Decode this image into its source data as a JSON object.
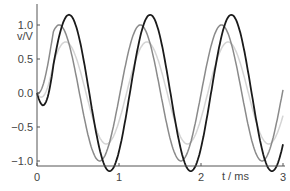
{
  "chart_data": {
    "type": "line",
    "title": "",
    "xlabel": "t / ms",
    "ylabel": "v/V",
    "xlim": [
      0,
      3
    ],
    "ylim": [
      -1.1,
      1.2
    ],
    "grid": false,
    "legend": null,
    "x_ticks": [
      "0",
      "1",
      "2",
      "3"
    ],
    "y_ticks": [
      "1.0",
      "0.5",
      "0.0",
      "−0.5",
      "−1.0"
    ],
    "series": [
      {
        "name": "black",
        "color": "#1a1a1a",
        "amplitude": 1.15,
        "period_ms": 0.99,
        "peaks_t": [
          0.39,
          1.38,
          2.37
        ],
        "troughs_t": [
          0.88,
          1.87,
          2.86
        ]
      },
      {
        "name": "gray",
        "color": "#8a8a8a",
        "amplitude": 1.0,
        "period_ms": 0.99,
        "peaks_t": [
          0.27,
          1.26,
          2.24
        ],
        "troughs_t": [
          0.72,
          1.71,
          2.7
        ]
      },
      {
        "name": "light-gray",
        "color": "#d4d4d4",
        "amplitude": 0.75,
        "period_ms": 0.99,
        "peaks_t": [
          0.35,
          1.34,
          2.33
        ],
        "troughs_t": [
          0.84,
          1.83,
          2.82
        ]
      }
    ]
  }
}
